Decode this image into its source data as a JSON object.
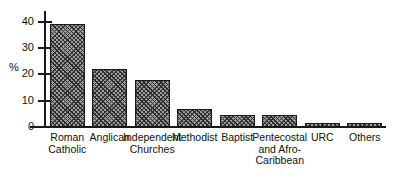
{
  "chart_data": {
    "type": "bar",
    "title": "",
    "subtitle": "",
    "xlabel": "",
    "ylabel": "%",
    "ylim": [
      0,
      44
    ],
    "grid": false,
    "legend": "none",
    "y_ticks": [
      0,
      10,
      20,
      30,
      40
    ],
    "y_tick_labels": [
      "0",
      "10",
      "20",
      "30",
      "40"
    ],
    "categories": [
      "Roman\nCatholic",
      "Anglican",
      "Independent\nChurches",
      "Methodist",
      "Baptist",
      "Pentecostal\nand Afro-\nCaribbean",
      "URC",
      "Others"
    ],
    "values": [
      39,
      22,
      18,
      7,
      4.5,
      4.5,
      1.5,
      1
    ],
    "bar_style": "hatched",
    "bar_fill_color": "#9d9d9d",
    "bar_edge_color": "#1a1a1a",
    "axis_color": "#1a1a1a",
    "background_color": "#ffffff"
  },
  "axis": {
    "unit_label": "%"
  }
}
